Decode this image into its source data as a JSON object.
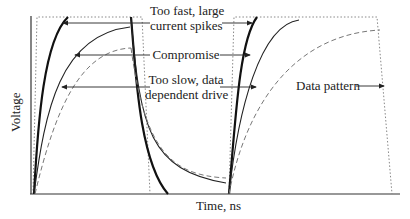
{
  "diagram": {
    "axes": {
      "x_label": "Time, ns",
      "y_label": "Voltage"
    },
    "annotations": [
      {
        "id": "too_fast",
        "lines": [
          "Too fast, large",
          "current spikes"
        ]
      },
      {
        "id": "compromise",
        "lines": [
          "Compromise"
        ]
      },
      {
        "id": "too_slow",
        "lines": [
          "Too slow, data",
          "dependent drive"
        ]
      },
      {
        "id": "data_pattern",
        "lines": [
          "Data pattern"
        ]
      }
    ],
    "curves": [
      {
        "name": "Data pattern",
        "style": "dotted",
        "color": "#888888"
      },
      {
        "name": "Too fast, large current spikes",
        "style": "thick-solid",
        "color": "#111111"
      },
      {
        "name": "Compromise",
        "style": "thin-solid",
        "color": "#222222"
      },
      {
        "name": "Too slow, data dependent drive",
        "style": "dashed",
        "color": "#777777"
      }
    ]
  }
}
